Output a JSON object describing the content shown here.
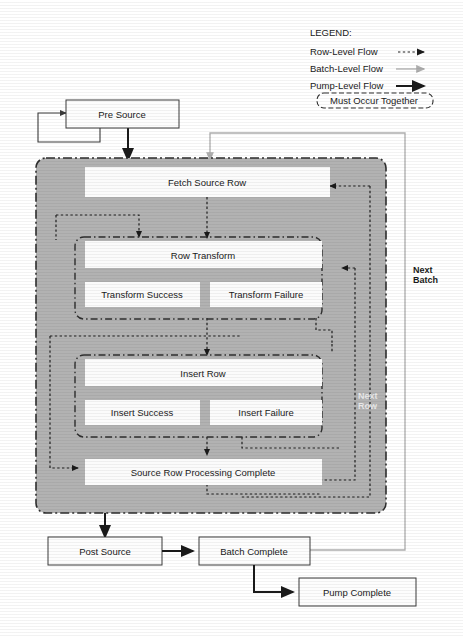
{
  "diagram": {
    "colors": {
      "panel_gray": "#b2b2b2",
      "box_white": "#fdfdfd",
      "row_flow": "#1f1f1f",
      "batch_flow": "#adadad",
      "pump_flow": "#1a1a1a",
      "text": "#1a1a1a",
      "light_text": "#e8e8e8"
    },
    "legend": {
      "heading": "LEGEND:",
      "entries": [
        {
          "label": "Row-Level Flow",
          "style": "dashed-arrow",
          "color": "#1f1f1f"
        },
        {
          "label": "Batch-Level Flow",
          "style": "solid-arrow",
          "color": "#adadad"
        },
        {
          "label": "Pump-Level Flow",
          "style": "solid-bold-arrow",
          "color": "#1a1a1a"
        },
        {
          "label": "Must Occur Together",
          "style": "dashed-rounded-box",
          "color": "#2e2e2e"
        }
      ]
    },
    "nodes": {
      "pre_source": "Pre Source",
      "fetch_source_row": "Fetch Source Row",
      "row_transform": "Row Transform",
      "transform_success": "Transform Success",
      "transform_failure": "Transform Failure",
      "insert_row": "Insert Row",
      "insert_success": "Insert Success",
      "insert_failure": "Insert Failure",
      "source_row_processing_complete": "Source Row Processing Complete",
      "post_source": "Post Source",
      "batch_complete": "Batch Complete",
      "pump_complete": "Pump Complete"
    },
    "edge_labels": {
      "next_batch_line1": "Next",
      "next_batch_line2": "Batch",
      "next_row_line1": "Next",
      "next_row_line2": "Row"
    }
  }
}
